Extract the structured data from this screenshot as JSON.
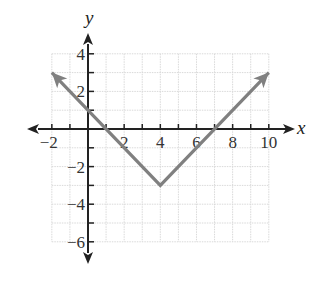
{
  "chart_data": {
    "type": "line",
    "title": "",
    "xlabel": "x",
    "ylabel": "y",
    "xlim": [
      -2,
      10
    ],
    "ylim": [
      -6,
      4
    ],
    "grid": true,
    "x_ticks": [
      -2,
      -1,
      0,
      1,
      2,
      3,
      4,
      5,
      6,
      7,
      8,
      9,
      10
    ],
    "y_ticks": [
      -6,
      -5,
      -4,
      -3,
      -2,
      -1,
      0,
      1,
      2,
      3,
      4
    ],
    "x_tick_labels": [
      "−2",
      "2",
      "4",
      "6",
      "8",
      "10"
    ],
    "x_tick_label_values": [
      -2,
      2,
      4,
      6,
      8,
      10
    ],
    "y_tick_labels": [
      "4",
      "2",
      "−2",
      "−4",
      "−6"
    ],
    "y_tick_label_values": [
      4,
      2,
      -2,
      -4,
      -6
    ],
    "series": [
      {
        "name": "y = |x − 4| − 3",
        "x": [
          -2,
          4,
          10
        ],
        "y": [
          3,
          -3,
          3
        ],
        "color": "#808080",
        "arrows_at_ends": true
      }
    ],
    "vertex": [
      4,
      -3
    ],
    "legend": "none"
  },
  "colors": {
    "axis": "#222222",
    "grid": "#d9d9d9",
    "line": "#808080",
    "background": "#ffffff"
  }
}
